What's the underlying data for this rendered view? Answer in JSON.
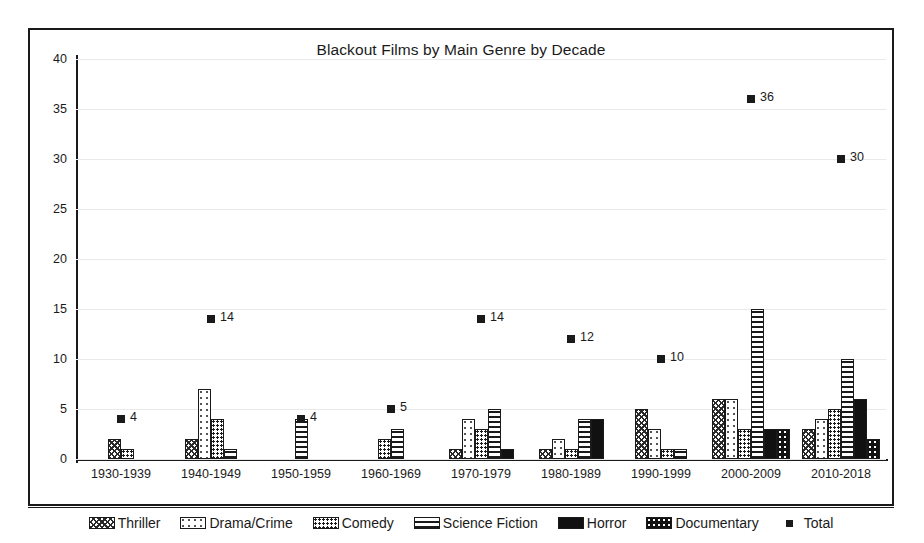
{
  "chart_data": {
    "type": "bar",
    "title": "Blackout Films by Main Genre by Decade",
    "xlabel": "",
    "ylabel": "",
    "ylim": [
      0,
      40
    ],
    "yticks": [
      0,
      5,
      10,
      15,
      20,
      25,
      30,
      35,
      40
    ],
    "grid": true,
    "legend_position": "bottom",
    "categories": [
      "1930-1939",
      "1940-1949",
      "1950-1959",
      "1960-1969",
      "1970-1979",
      "1980-1989",
      "1990-1999",
      "2000-2009",
      "2010-2018"
    ],
    "series": [
      {
        "name": "Thriller",
        "pattern": "p-thriller",
        "values": [
          2,
          2,
          0,
          0,
          1,
          1,
          5,
          6,
          3
        ]
      },
      {
        "name": "Drama/Crime",
        "pattern": "p-drama",
        "values": [
          0,
          7,
          0,
          0,
          4,
          2,
          3,
          6,
          4
        ]
      },
      {
        "name": "Comedy",
        "pattern": "p-comedy",
        "values": [
          1,
          4,
          0,
          2,
          3,
          1,
          1,
          3,
          5
        ]
      },
      {
        "name": "Science Fiction",
        "pattern": "p-scifi",
        "values": [
          0,
          1,
          4,
          3,
          5,
          4,
          1,
          15,
          10
        ]
      },
      {
        "name": "Horror",
        "pattern": "p-horror",
        "values": [
          0,
          0,
          0,
          0,
          1,
          4,
          0,
          3,
          6
        ]
      },
      {
        "name": "Documentary",
        "pattern": "p-documentary",
        "values": [
          0,
          0,
          0,
          0,
          0,
          0,
          0,
          3,
          2
        ]
      }
    ],
    "total_series": {
      "name": "Total",
      "marker": "square",
      "values": [
        4,
        14,
        4,
        5,
        14,
        12,
        10,
        36,
        30
      ]
    }
  },
  "legend": {
    "items": [
      {
        "label": "Thriller",
        "pattern": "p-thriller"
      },
      {
        "label": "Drama/Crime",
        "pattern": "p-drama"
      },
      {
        "label": "Comedy",
        "pattern": "p-comedy"
      },
      {
        "label": "Science Fiction",
        "pattern": "p-scifi"
      },
      {
        "label": "Horror",
        "pattern": "p-horror"
      },
      {
        "label": "Documentary",
        "pattern": "p-documentary"
      },
      {
        "label": "Total",
        "pattern": "marker-only"
      }
    ]
  },
  "colors": {
    "ink": "#1a1a1a",
    "grid": "#e9e9e9",
    "background": "#ffffff"
  }
}
